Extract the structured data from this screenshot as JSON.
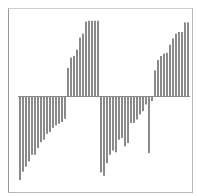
{
  "chart_data": {
    "type": "bar",
    "title": "",
    "xlabel": "",
    "ylabel": "",
    "grid": false,
    "legend": null,
    "baseline": 0,
    "ylim": [
      -1.0,
      1.0
    ],
    "bar_color": "#8a8a8a",
    "axis_color": "#8a8a8a",
    "frame_color": "#b8b8b8",
    "categories": [
      "1",
      "2",
      "3",
      "4",
      "5",
      "6",
      "7",
      "8",
      "9",
      "10",
      "11",
      "12",
      "13",
      "14",
      "15",
      "16",
      "17",
      "18",
      "19",
      "20",
      "21",
      "22",
      "23",
      "24",
      "25",
      "26",
      "27",
      "28",
      "29",
      "30",
      "31",
      "32",
      "33",
      "34",
      "35",
      "36",
      "37",
      "38",
      "39",
      "40",
      "41",
      "42",
      "43",
      "44",
      "45",
      "46",
      "47",
      "48",
      "49",
      "50",
      "51",
      "52",
      "53",
      "54",
      "55",
      "56",
      "57"
    ],
    "values": [
      -1.0,
      -0.9,
      -0.84,
      -0.78,
      -0.7,
      -0.7,
      -0.62,
      -0.55,
      -0.52,
      -0.45,
      -0.43,
      -0.38,
      -0.35,
      -0.33,
      -0.31,
      -0.27,
      0.35,
      0.48,
      0.5,
      0.58,
      0.73,
      0.78,
      0.93,
      0.94,
      0.94,
      0.94,
      0.94,
      -0.91,
      -0.95,
      -0.8,
      -0.7,
      -0.65,
      -0.67,
      -0.52,
      -0.5,
      -0.6,
      -0.56,
      -0.32,
      -0.32,
      -0.28,
      -0.22,
      -0.18,
      -0.1,
      -0.68,
      -0.06,
      0.32,
      0.45,
      0.5,
      0.53,
      0.54,
      0.64,
      0.72,
      0.78,
      0.8,
      0.8,
      0.92,
      0.92
    ]
  }
}
